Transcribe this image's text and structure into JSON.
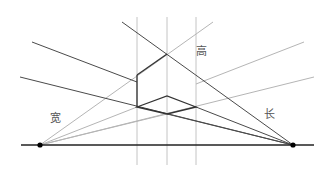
{
  "diagram": {
    "labels": {
      "width": "宽",
      "height": "高",
      "length": "长"
    },
    "colors": {
      "dark_line": "#444444",
      "light_line": "#b5b5b5",
      "horizon": "#222222",
      "vanishing_point": "#000000",
      "label": "#555555"
    },
    "horizon": {
      "x1": 21,
      "y1": 145,
      "x2": 314,
      "y2": 145
    },
    "vanishing_points": [
      {
        "name": "left",
        "x": 40,
        "y": 145
      },
      {
        "name": "right",
        "x": 293,
        "y": 145
      }
    ],
    "verticals_x": [
      137,
      167,
      196
    ]
  }
}
